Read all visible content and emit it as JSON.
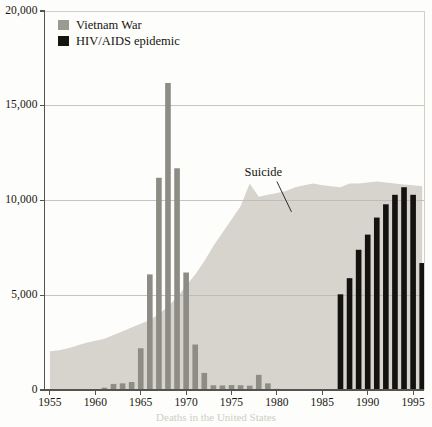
{
  "chart_data": {
    "type": "bar",
    "title": "",
    "subtitle": "",
    "xlabel": "",
    "ylabel": "",
    "xlim": [
      1954.4,
      1996.2
    ],
    "ylim": [
      0,
      20000
    ],
    "grid": true,
    "legend_position": "top-left",
    "y_ticks": [
      {
        "value": 20000,
        "label": "20,000"
      },
      {
        "value": 15000,
        "label": "15,000"
      },
      {
        "value": 10000,
        "label": "10,000"
      },
      {
        "value": 5000,
        "label": "5,000"
      },
      {
        "value": 0,
        "label": "0"
      }
    ],
    "x_ticks": [
      {
        "value": 1955,
        "label": "1955"
      },
      {
        "value": 1960,
        "label": "1960"
      },
      {
        "value": 1965,
        "label": "1965"
      },
      {
        "value": 1970,
        "label": "1970"
      },
      {
        "value": 1975,
        "label": "1975"
      },
      {
        "value": 1980,
        "label": "1980"
      },
      {
        "value": 1985,
        "label": "1985"
      },
      {
        "value": 1990,
        "label": "1990"
      },
      {
        "value": 1995,
        "label": "1995"
      }
    ],
    "legend": [
      {
        "name": "vietnam-war",
        "label": "Vietnam War",
        "color": "#9a9a92"
      },
      {
        "name": "hiv-aids",
        "label": "HIV/AIDS epidemic",
        "color": "#17150f"
      }
    ],
    "annotations": [
      {
        "name": "suicide",
        "label": "Suicide",
        "text_x": 1979.3,
        "text_y": 11450,
        "leader_from": [
          1980.0,
          11000
        ],
        "leader_to": [
          1981.6,
          9400
        ],
        "color": "#17150f"
      }
    ],
    "series": [
      {
        "name": "suicide",
        "label": "Suicide",
        "type": "area",
        "color": "#d6d4cc",
        "x": [
          1955,
          1956,
          1957,
          1958,
          1959,
          1960,
          1961,
          1962,
          1963,
          1964,
          1965,
          1966,
          1967,
          1968,
          1969,
          1970,
          1971,
          1972,
          1973,
          1974,
          1975,
          1976,
          1977,
          1978,
          1979,
          1980,
          1981,
          1982,
          1983,
          1984,
          1985,
          1986,
          1987,
          1988,
          1989,
          1990,
          1991,
          1992,
          1993,
          1994,
          1995,
          1996
        ],
        "values": [
          2050,
          2100,
          2200,
          2350,
          2500,
          2600,
          2700,
          2900,
          3100,
          3300,
          3500,
          3700,
          4000,
          4400,
          4900,
          5500,
          6100,
          6800,
          7600,
          8300,
          9000,
          9700,
          10900,
          10200,
          10300,
          10400,
          10500,
          10700,
          10800,
          10900,
          10800,
          10750,
          10700,
          10900,
          10900,
          10950,
          11000,
          10950,
          10900,
          10850,
          10800,
          10750
        ]
      },
      {
        "name": "vietnam-war",
        "label": "Vietnam War",
        "type": "bar",
        "color": "#8d8d85",
        "x": [
          1961,
          1962,
          1963,
          1964,
          1965,
          1966,
          1967,
          1968,
          1969,
          1970,
          1971,
          1972,
          1973,
          1974,
          1975,
          1976,
          1977,
          1978,
          1979,
          1980
        ],
        "values": [
          120,
          320,
          350,
          420,
          2200,
          6100,
          11200,
          16200,
          11700,
          6200,
          2400,
          900,
          250,
          240,
          260,
          250,
          230,
          800,
          350,
          60
        ]
      },
      {
        "name": "hiv-aids",
        "label": "HIV/AIDS epidemic",
        "type": "bar",
        "color": "#141210",
        "x": [
          1987,
          1988,
          1989,
          1990,
          1991,
          1992,
          1993,
          1994,
          1995,
          1996
        ],
        "values": [
          5050,
          5900,
          7400,
          8200,
          9100,
          9800,
          10300,
          10700,
          10300,
          6700
        ]
      }
    ]
  },
  "caption": {
    "text": "Deaths in the United States"
  }
}
